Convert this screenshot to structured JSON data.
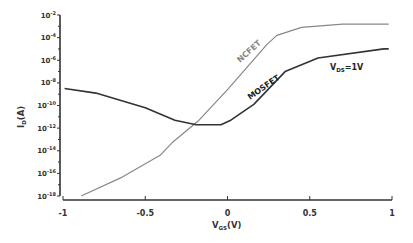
{
  "chart_data": {
    "type": "line",
    "title": "",
    "xlabel": "V_GS(V)",
    "ylabel": "I_D(A)",
    "xlim": [
      -1,
      1
    ],
    "ylim_log10": [
      -18,
      -2
    ],
    "yscale": "log",
    "grid": false,
    "x_ticks": [
      "-1",
      "-0.5",
      "0",
      "0.5",
      "1"
    ],
    "y_ticks": [
      "10^-2",
      "10^-4",
      "10^-6",
      "10^-8",
      "10^-10",
      "10^-12",
      "10^-14",
      "10^-16",
      "10^-18"
    ],
    "annotations": [
      "NCFET",
      "MOSFET",
      "V_DS=1V"
    ],
    "series": [
      {
        "name": "NCFET",
        "color": "#888888",
        "x": [
          -0.89,
          -0.65,
          -0.41,
          -0.33,
          -0.18,
          0.0,
          0.15,
          0.24,
          0.3,
          0.45,
          0.7,
          0.98
        ],
        "log10_y": [
          -18.0,
          -16.4,
          -14.4,
          -13.2,
          -11.4,
          -8.6,
          -6.1,
          -4.6,
          -3.8,
          -3.1,
          -2.8,
          -2.8
        ]
      },
      {
        "name": "MOSFET",
        "color": "#333333",
        "x": [
          -0.99,
          -0.8,
          -0.5,
          -0.32,
          -0.19,
          -0.04,
          0.02,
          0.16,
          0.35,
          0.55,
          0.95,
          0.98
        ],
        "log10_y": [
          -8.5,
          -8.9,
          -10.2,
          -11.3,
          -11.7,
          -11.7,
          -11.3,
          -9.9,
          -7.0,
          -5.8,
          -5.0,
          -5.0
        ]
      }
    ]
  },
  "labels": {
    "ncfet": "NCFET",
    "mosfet": "MOSFET",
    "vds_prefix": "V",
    "vds_sub": "DS",
    "vds_suffix": "=1V",
    "xlabel_main": "V",
    "xlabel_sub": "GS",
    "xlabel_unit": "(V)",
    "ylabel_main": "I",
    "ylabel_sub": "D",
    "ylabel_unit": "(A)"
  }
}
